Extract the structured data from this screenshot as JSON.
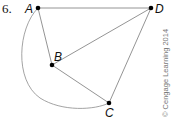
{
  "problem_number": "6.",
  "points": {
    "A": {
      "label": "A",
      "x": 38,
      "y": 8
    },
    "B": {
      "label": "B",
      "x": 52,
      "y": 65
    },
    "C": {
      "label": "C",
      "x": 109,
      "y": 103
    },
    "D": {
      "label": "D",
      "x": 151,
      "y": 8
    }
  },
  "segments": [
    "AD",
    "AB",
    "BD",
    "BC",
    "CD"
  ],
  "arc": {
    "from": "A",
    "to": "C"
  },
  "credit": "© Cengage Learning 2014",
  "colors": {
    "line": "#888888",
    "point": "#000000",
    "credit": "#777777"
  }
}
